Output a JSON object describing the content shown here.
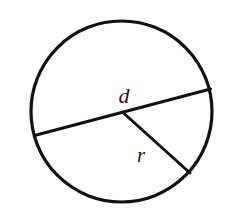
{
  "figure": {
    "name": "circle-with-diameter-and-radius",
    "background_color": "#ffffff",
    "stroke_color": "#111111",
    "label_color": "#1a1a1a",
    "canvas": {
      "width": 230,
      "height": 211
    },
    "circle": {
      "name": "circle-outline",
      "cx": 121.5,
      "cy": 111.5,
      "r": 90.5,
      "stroke_width": 3.2
    },
    "diameter": {
      "name": "diameter-segment",
      "label": "d",
      "x1": 34.5,
      "y1": 135.5,
      "x2": 210.5,
      "y2": 89.0,
      "stroke_width": 3.0,
      "label_x": 124,
      "label_y": 103,
      "label_font_size": 22
    },
    "radius": {
      "name": "radius-segment",
      "label": "r",
      "x1": 123.5,
      "y1": 113.0,
      "x2": 190.0,
      "y2": 173.0,
      "stroke_width": 3.0,
      "label_x": 141,
      "label_y": 162,
      "label_font_size": 21
    }
  }
}
